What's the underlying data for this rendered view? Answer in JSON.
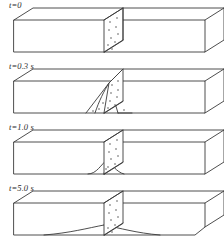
{
  "figure": {
    "type": "technical-illustration",
    "line_color": "#3a3a3a",
    "stipple_color": "#4a4a4a",
    "background": "#ffffff",
    "panel_count": 4
  },
  "panels": [
    {
      "id": "panel-t0",
      "time_label": "t=0",
      "time_value": "0",
      "time_units": "",
      "label_x": 9,
      "label_y": 2,
      "profile": "none",
      "profile_width": 0,
      "profile_height": 0,
      "bevel_right": false,
      "note": "initial state: vertical slab only, no spreading curve"
    },
    {
      "id": "panel-t03",
      "time_label": "t=0.3 s",
      "time_value": "0.3",
      "time_units": "s",
      "label_x": 9,
      "label_y": 62,
      "profile": "tent",
      "profile_width": 46,
      "profile_height": 22,
      "bevel_right": false,
      "note": "sharp tent-shaped triangular disturbance below slab"
    },
    {
      "id": "panel-t10",
      "time_label": "t=1.0 s",
      "time_value": "1.0",
      "time_units": "s",
      "label_x": 9,
      "label_y": 123,
      "profile": "bump",
      "profile_width": 44,
      "profile_height": 14,
      "bevel_right": false,
      "note": "narrow rounded bump on the lower face"
    },
    {
      "id": "panel-t50",
      "time_label": "t=5.0 s",
      "time_value": "5.0",
      "time_units": "s",
      "label_x": 9,
      "label_y": 186,
      "profile": "wide-arc",
      "profile_width": 148,
      "profile_height": 9,
      "bevel_right": true,
      "note": "broad shallow arc spanning most of the bar; right corner beveled"
    }
  ],
  "box_geometry": {
    "front_left_x": 14,
    "front_right_x": 205,
    "front_top_y": 20,
    "front_bottom_y": 52,
    "depth_dx": 19,
    "depth_dy": -12,
    "slab_front_x": 104,
    "slab_width": 0,
    "slab_back_x": 123
  },
  "slab": {
    "name": "cross-section-slab",
    "fill": "#ffffff",
    "stipple_dot_count": 9,
    "stipple_dot_radius": 0.7
  }
}
